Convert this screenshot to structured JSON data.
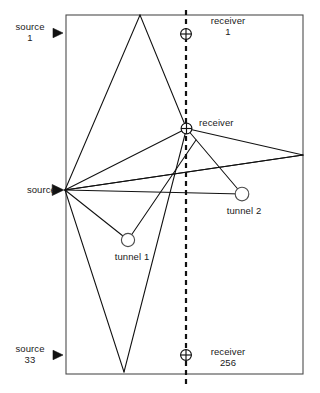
{
  "figure": {
    "kind": "ray-path-diagram",
    "domain_outline": {
      "shape": "rectangle",
      "x": 66,
      "y": 15,
      "width": 237,
      "height": 359,
      "stroke": "#4d4d4d",
      "stroke_width": 1.1
    },
    "receiver_line": {
      "name": "dashed-vertical-receiver-line",
      "x": 186,
      "y_top": 10,
      "y_bottom": 384,
      "style": "dashed",
      "stroke": "#111111",
      "stroke_width": 2.2,
      "dash": "5,4"
    },
    "background": "#ffffff",
    "ink": "#111111"
  },
  "labels": {
    "source_first": {
      "line1": "source",
      "line2": "1"
    },
    "source_last": {
      "line1": "source",
      "line2": "33"
    },
    "source_hub": {
      "line1": "source"
    },
    "receiver_first": {
      "line1": "receiver",
      "line2": "1"
    },
    "receiver_last": {
      "line1": "receiver",
      "line2": "256"
    },
    "receiver_hub": {
      "line1": "receiver"
    },
    "tunnel_one": {
      "line1": "tunnel  1"
    },
    "tunnel_two": {
      "line1": "tunnel  2"
    }
  },
  "markers": {
    "sources": [
      {
        "name": "source-marker-1",
        "label_key": "source_first",
        "x": 58,
        "y": 33,
        "glyph": "right-triangle",
        "size": 9.5
      },
      {
        "name": "source-marker-hub",
        "label_key": "source_hub",
        "x": 58,
        "y": 190,
        "glyph": "right-triangle",
        "size": 11
      },
      {
        "name": "source-marker-33",
        "label_key": "source_last",
        "x": 58,
        "y": 355,
        "glyph": "right-triangle",
        "size": 9.5
      }
    ],
    "receivers": [
      {
        "name": "receiver-marker-1",
        "label_key": "receiver_first",
        "x": 186,
        "y": 34,
        "glyph": "circle-cross",
        "r": 5.4
      },
      {
        "name": "receiver-marker-hub",
        "label_key": "receiver_hub",
        "x": 186.5,
        "y": 128.5,
        "glyph": "circle-cross",
        "r": 5.4
      },
      {
        "name": "receiver-marker-256",
        "label_key": "receiver_last",
        "x": 186,
        "y": 355,
        "glyph": "circle-cross",
        "r": 5.4
      }
    ],
    "tunnels": [
      {
        "name": "tunnel-circle-1",
        "label_key": "tunnel_one",
        "x": 128,
        "y": 240,
        "r": 6.6
      },
      {
        "name": "tunnel-circle-2",
        "label_key": "tunnel_two",
        "x": 242,
        "y": 194,
        "r": 6.8
      }
    ]
  },
  "ray_paths": [
    {
      "name": "ray-source-hub-to-top-apex",
      "points": [
        [
          65,
          190
        ],
        [
          140,
          15
        ]
      ]
    },
    {
      "name": "ray-top-apex-to-receiver-hub",
      "points": [
        [
          140,
          15
        ],
        [
          186.5,
          128.5
        ]
      ]
    },
    {
      "name": "ray-source-hub-to-receiver-hub",
      "points": [
        [
          65,
          190
        ],
        [
          186.5,
          128.5
        ]
      ]
    },
    {
      "name": "ray-source-hub-to-right-edge-upper",
      "points": [
        [
          65,
          190
        ],
        [
          303,
          155
        ]
      ]
    },
    {
      "name": "ray-receiver-hub-to-right-edge",
      "points": [
        [
          186.5,
          128.5
        ],
        [
          303,
          155
        ]
      ]
    },
    {
      "name": "ray-source-hub-to-tunnel2",
      "points": [
        [
          65,
          190
        ],
        [
          242,
          194
        ]
      ]
    },
    {
      "name": "ray-receiver-hub-to-tunnel2",
      "points": [
        [
          186.5,
          128.5
        ],
        [
          242,
          194
        ]
      ]
    },
    {
      "name": "ray-source-hub-to-tunnel1",
      "points": [
        [
          65,
          190
        ],
        [
          128,
          240
        ]
      ]
    },
    {
      "name": "ray-tunnel1-to-receiver-hub-region",
      "points": [
        [
          128,
          240
        ],
        [
          196,
          140
        ]
      ]
    },
    {
      "name": "ray-source-hub-to-bottom-apex",
      "points": [
        [
          65,
          190
        ],
        [
          124,
          372
        ]
      ]
    },
    {
      "name": "ray-bottom-apex-up-right",
      "points": [
        [
          124,
          372
        ],
        [
          186.5,
          128.5
        ]
      ]
    },
    {
      "name": "ray-right-edge-to-source-hub-low",
      "points": [
        [
          303,
          155
        ],
        [
          65,
          190
        ]
      ]
    }
  ],
  "styles": {
    "ray_stroke": "#111111",
    "ray_width": 1.05,
    "marker_fill": "#ffffff",
    "marker_stroke": "#111111"
  }
}
